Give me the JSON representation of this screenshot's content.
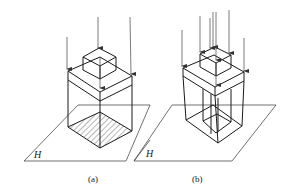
{
  "figure": {
    "panels": [
      {
        "id": "a",
        "caption": "(a)",
        "plane_label": "H",
        "description": "Prism with box on top, parallel projection onto plane H, hatched shadow"
      },
      {
        "id": "b",
        "caption": "(b)",
        "plane_label": "H",
        "description": "Prism with box on top and hollow interior, parallel projection onto plane H"
      }
    ]
  },
  "colors": {
    "line": "#1a1a1a",
    "arrow": "#444444",
    "background": "#ffffff"
  }
}
